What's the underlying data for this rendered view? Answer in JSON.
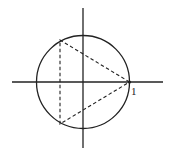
{
  "diagram": {
    "axes": {
      "origin": [
        83,
        82
      ],
      "x_axis": {
        "x1": 12,
        "x2": 163,
        "y": 82
      },
      "y_axis": {
        "x": 83,
        "y1": 8,
        "y2": 148
      }
    },
    "circle": {
      "cx": 83,
      "cy": 82,
      "r": 46.5
    },
    "triangle": {
      "style": "dashed",
      "vertices": [
        [
          129.5,
          82
        ],
        [
          60,
          40
        ],
        [
          60,
          124
        ]
      ]
    },
    "labels": [
      {
        "text": "1",
        "x": 131,
        "y": 95
      }
    ],
    "color": "#222222"
  }
}
